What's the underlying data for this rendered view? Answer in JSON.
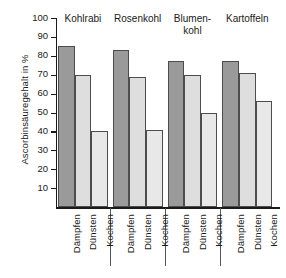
{
  "chart_data": {
    "type": "bar",
    "title": "",
    "xlabel": "",
    "ylabel": "Ascorbinsäuregehalt in %",
    "ylim": [
      0,
      100
    ],
    "ytick_labels": [
      "100",
      "90",
      "80",
      "70",
      "60",
      "50",
      "40",
      "30",
      "20",
      "10"
    ],
    "ytick_values": [
      100,
      90,
      80,
      70,
      60,
      50,
      40,
      30,
      20,
      10
    ],
    "grid": false,
    "legend": "none",
    "categories": [
      "Dämpfen",
      "Dünsten",
      "Kochen"
    ],
    "groups": [
      {
        "label": "Kohlrabi",
        "bars": [
          {
            "category": "Dämpfen",
            "value": 85,
            "style": "daempfen"
          },
          {
            "category": "Dünsten",
            "value": 70,
            "style": "duensten"
          },
          {
            "category": "Kochen",
            "value": 40,
            "style": "kochen"
          }
        ]
      },
      {
        "label": "Rosenkohl",
        "bars": [
          {
            "category": "Dämpfen",
            "value": 83,
            "style": "daempfen"
          },
          {
            "category": "Dünsten",
            "value": 69,
            "style": "duensten"
          },
          {
            "category": "Kochen",
            "value": 41,
            "style": "kochen"
          }
        ]
      },
      {
        "label": "Blumen-\nkohl",
        "bars": [
          {
            "category": "Dämpfen",
            "value": 77,
            "style": "daempfen"
          },
          {
            "category": "Dünsten",
            "value": 70,
            "style": "duensten"
          },
          {
            "category": "Kochen",
            "value": 50,
            "style": "kochen"
          }
        ]
      },
      {
        "label": "Kartoffeln",
        "bars": [
          {
            "category": "Dämpfen",
            "value": 77,
            "style": "daempfen"
          },
          {
            "category": "Dünsten",
            "value": 71,
            "style": "duensten"
          },
          {
            "category": "Kochen",
            "value": 56,
            "style": "kochen"
          }
        ]
      }
    ],
    "colors": {
      "daempfen": "#9a9a9a",
      "duensten": "#dedede",
      "kochen": "#e8e8e8",
      "outline": "#4d4d4d",
      "axis": "#1a1a1a",
      "background": "#ffffff"
    }
  }
}
